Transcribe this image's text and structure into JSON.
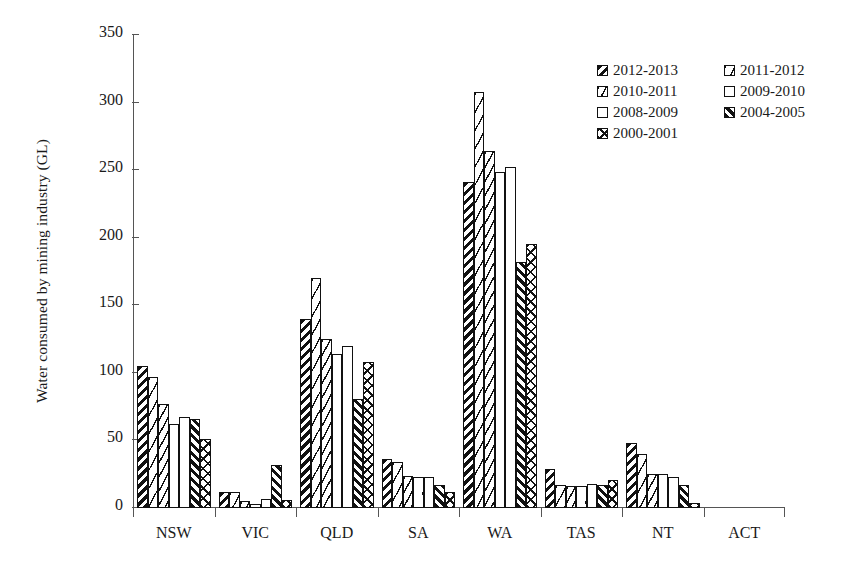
{
  "chart_data": {
    "type": "bar",
    "title": "",
    "subtitle": "",
    "xlabel": "",
    "ylabel": "Water consumed by mining industry (GL)",
    "ylim": [
      0,
      350
    ],
    "ytick_step": 50,
    "yticks": [
      0,
      50,
      100,
      150,
      200,
      250,
      300,
      350
    ],
    "ytick_labels": [
      "0",
      "50",
      "100",
      "150",
      "200",
      "250",
      "300",
      "350"
    ],
    "grid": false,
    "legend_position": "top-right",
    "legend_columns": 2,
    "orientation": "vertical",
    "categories": [
      "NSW",
      "VIC",
      "QLD",
      "SA",
      "WA",
      "TAS",
      "NT",
      "ACT"
    ],
    "series": [
      {
        "name": "2012-2013",
        "pattern": "bold-diagonal-backslash",
        "values": [
          105,
          12,
          140,
          36,
          241,
          29,
          48,
          0
        ]
      },
      {
        "name": "2011-2012",
        "pattern": "fine-dash-light",
        "values": [
          97,
          12,
          170,
          34,
          308,
          17,
          40,
          0
        ]
      },
      {
        "name": "2010-2011",
        "pattern": "fine-dash-dense",
        "values": [
          77,
          5,
          125,
          24,
          264,
          16,
          25,
          0
        ]
      },
      {
        "name": "2009-2010",
        "pattern": "sparse-dots",
        "values": [
          62,
          3,
          114,
          23,
          249,
          16,
          25,
          0
        ]
      },
      {
        "name": "2008-2009",
        "pattern": "plain-white",
        "values": [
          67,
          7,
          120,
          23,
          252,
          18,
          23,
          0
        ]
      },
      {
        "name": "2004-2005",
        "pattern": "bold-diagonal-slash",
        "values": [
          66,
          32,
          81,
          17,
          182,
          17,
          17,
          0
        ]
      },
      {
        "name": "2000-2001",
        "pattern": "cross-hatch",
        "values": [
          51,
          6,
          108,
          12,
          195,
          21,
          4,
          0
        ]
      }
    ]
  },
  "colors": {
    "ink": "#111111",
    "axis": "#555555",
    "background": "#ffffff"
  }
}
